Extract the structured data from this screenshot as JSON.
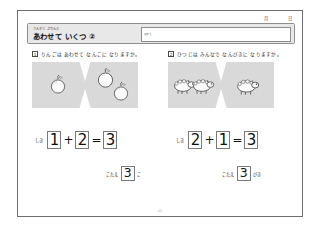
{
  "header": {
    "date_month_label": "月",
    "date_day_label": "日",
    "title_kicker": "さんすう ぷりんと",
    "title_main": "あわせて いくつ ②",
    "name_field_label": "なまえ",
    "name_field_value": ""
  },
  "questions": [
    {
      "number": "1",
      "prompt": "りんごは あわせて なんこに なりますか。",
      "panels": [
        {
          "kind": "apple",
          "count": 1
        },
        {
          "kind": "apple",
          "count": 2
        }
      ],
      "equation": {
        "label": "しき",
        "operand_a": "1",
        "operator": "+",
        "operand_b": "2",
        "equals": "=",
        "result": "3"
      },
      "answer": {
        "label": "こたえ",
        "value": "3",
        "unit": "こ"
      }
    },
    {
      "number": "2",
      "prompt": "ひつじは みんなで なんびきに なりますか。",
      "panels": [
        {
          "kind": "sheep",
          "count": 2
        },
        {
          "kind": "sheep",
          "count": 1
        }
      ],
      "equation": {
        "label": "しき",
        "operand_a": "2",
        "operator": "+",
        "operand_b": "1",
        "equals": "=",
        "result": "3"
      },
      "answer": {
        "label": "こたえ",
        "value": "3",
        "unit": "びき"
      }
    }
  ],
  "footer": {
    "page_number": "40"
  },
  "colors": {
    "panel_fill": "#d9d9d9",
    "titlebar_fill": "#e8e8e8",
    "rule": "#6d6d6d",
    "ink": "#111111"
  }
}
